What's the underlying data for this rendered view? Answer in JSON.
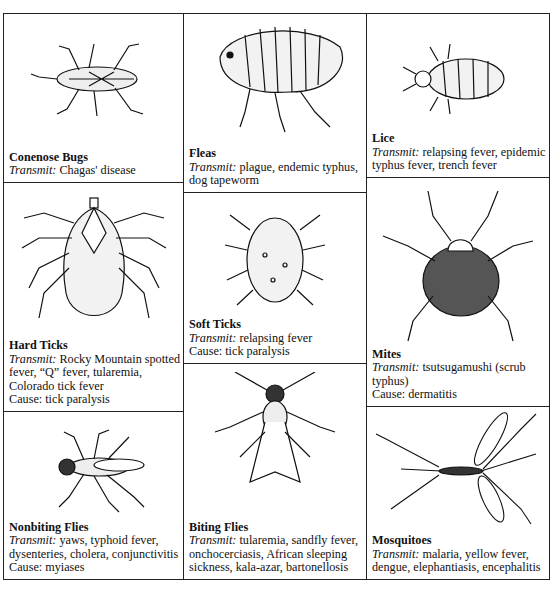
{
  "figure": {
    "transmit_label": "Transmit:",
    "cause_label": "Cause:",
    "cells": [
      {
        "id": "conenose-bugs",
        "name": "Conenose Bugs",
        "transmit": "Chagas' disease",
        "cause": null
      },
      {
        "id": "fleas",
        "name": "Fleas",
        "transmit": "plague, endemic typhus, dog tapeworm",
        "cause": null
      },
      {
        "id": "lice",
        "name": "Lice",
        "transmit": "relapsing fever, epidemic typhus fever, trench fever",
        "cause": null
      },
      {
        "id": "hard-ticks",
        "name": "Hard Ticks",
        "transmit": "Rocky Mountain spotted fever, “Q” fever, tularemia, Colorado tick fever",
        "cause": "tick paralysis"
      },
      {
        "id": "soft-ticks",
        "name": "Soft Ticks",
        "transmit": "relapsing fever",
        "cause": "tick paralysis"
      },
      {
        "id": "mites",
        "name": "Mites",
        "transmit": "tsutsugamushi (scrub typhus)",
        "cause": "dermatitis"
      },
      {
        "id": "nonbiting-flies",
        "name": "Nonbiting Flies",
        "transmit": "yaws, typhoid fever, dysenteries, cholera, conjunctivitis",
        "cause": "myiases"
      },
      {
        "id": "biting-flies",
        "name": "Biting Flies",
        "transmit": "tularemia, sandfly fever, onchocerciasis, African sleeping sickness, kala-azar, bartonellosis",
        "cause": null
      },
      {
        "id": "mosquitoes",
        "name": "Mosquitoes",
        "transmit": "malaria, yellow fever, dengue, elephantiasis, encephalitis",
        "cause": null
      }
    ]
  }
}
